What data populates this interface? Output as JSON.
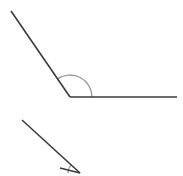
{
  "canvas": {
    "width": 183,
    "height": 176,
    "background_color": "#ffffff",
    "title": "Obtuse angle geometry figure"
  },
  "style": {
    "ray_color": "#3a3a42",
    "ray_width": 1.6,
    "arc_color": "#9a9a9a",
    "arc_width": 1.3
  },
  "chart_data": {
    "type": "diagram",
    "figures": [
      {
        "name": "upper-angle",
        "vertex": [
          70,
          97
        ],
        "rays": [
          {
            "name": "upper-left-ray",
            "from": [
              70,
              97
            ],
            "to": [
              11,
              11
            ],
            "direction_degrees": 124.5
          },
          {
            "name": "horizontal-right-ray",
            "from": [
              70,
              97
            ],
            "to": [
              177,
              97
            ],
            "direction_degrees": 0
          }
        ],
        "arc": {
          "name": "angle-arc",
          "center": [
            70,
            97
          ],
          "radius": 22,
          "start_degrees": 0,
          "end_degrees": 124.5,
          "measure_degrees": 124.5
        }
      },
      {
        "name": "lower-partial-angle",
        "vertex": [
          80,
          173
        ],
        "rays": [
          {
            "name": "lower-diagonal-ray",
            "from": [
              80,
              173
            ],
            "to": [
              22,
              120
            ],
            "direction_degrees": 137.6
          },
          {
            "name": "lower-second-ray",
            "from": [
              80,
              173
            ],
            "to": [
              60,
              168
            ],
            "direction_degrees": 166.0
          }
        ],
        "arc": {
          "name": "lower-angle-arc",
          "center": [
            80,
            173
          ],
          "radius": 12,
          "start_degrees": 137.6,
          "end_degrees": 180,
          "measure_degrees": 42.4
        },
        "note": "clipped by bottom edge of image"
      }
    ]
  }
}
